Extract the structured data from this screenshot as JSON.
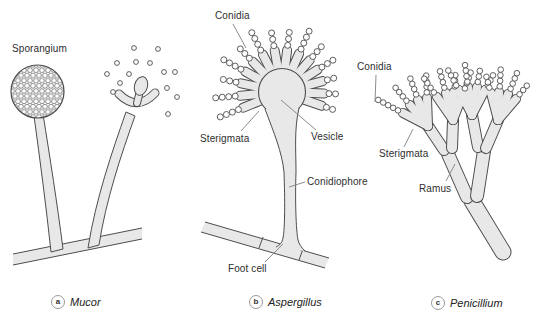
{
  "figure_type": "fungal-structures-diagram",
  "colors": {
    "structure_fill": "#e8e8e8",
    "structure_outline": "#4d4d4d",
    "leader_line": "#8c8c8c",
    "label_text": "#2e2e2e",
    "background": "#ffffff"
  },
  "labels": {
    "sporangium": "Sporangium",
    "conidia_b": "Conidia",
    "sterigmata_b": "Sterigmata",
    "vesicle": "Vesicle",
    "conidiophore": "Conidiophore",
    "foot_cell": "Foot cell",
    "conidia_c": "Conidia",
    "sterigmata_c": "Sterigmata",
    "ramus": "Ramus"
  },
  "captions": {
    "a": {
      "letter": "a",
      "name": "Mucor"
    },
    "b": {
      "letter": "b",
      "name": "Aspergillus"
    },
    "c": {
      "letter": "c",
      "name": "Penicillium"
    }
  }
}
